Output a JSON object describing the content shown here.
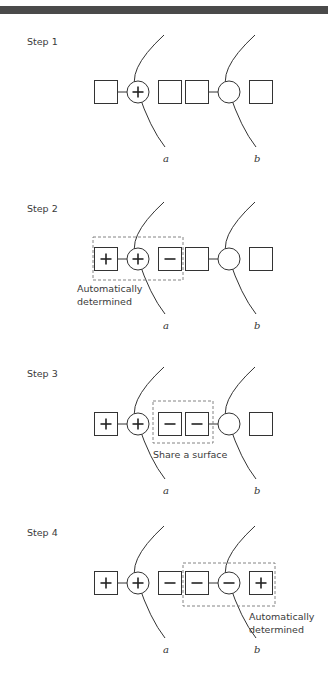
{
  "header": {
    "bar_color": "#4a4a4a"
  },
  "colors": {
    "stroke": "#333333",
    "dashed": "#777777",
    "text": "#3a3a3a"
  },
  "surfaces": {
    "a_label": "a",
    "b_label": "b"
  },
  "steps": [
    {
      "label": "Step 1",
      "row_y": 92,
      "elements": [
        {
          "type": "square",
          "x": 106,
          "sign": ""
        },
        {
          "type": "circle",
          "x": 138,
          "sign": "+"
        },
        {
          "type": "square",
          "x": 170,
          "sign": ""
        },
        {
          "type": "square",
          "x": 197,
          "sign": ""
        },
        {
          "type": "circle",
          "x": 229,
          "sign": ""
        },
        {
          "type": "square",
          "x": 261,
          "sign": ""
        }
      ],
      "links": [
        [
          117,
          127
        ],
        [
          208,
          218
        ]
      ],
      "dashed_box": null,
      "note": []
    },
    {
      "label": "Step 2",
      "row_y": 259,
      "elements": [
        {
          "type": "square",
          "x": 106,
          "sign": "+"
        },
        {
          "type": "circle",
          "x": 138,
          "sign": "+"
        },
        {
          "type": "square",
          "x": 170,
          "sign": "−"
        },
        {
          "type": "square",
          "x": 197,
          "sign": ""
        },
        {
          "type": "circle",
          "x": 229,
          "sign": ""
        },
        {
          "type": "square",
          "x": 261,
          "sign": ""
        }
      ],
      "links": [
        [
          117,
          127
        ],
        [
          208,
          218
        ]
      ],
      "dashed_box": {
        "x": 93,
        "y": 237,
        "w": 90,
        "h": 43
      },
      "note": [
        "Automatically",
        "determined"
      ],
      "note_pos": {
        "x": 77,
        "y": 292
      }
    },
    {
      "label": "Step 3",
      "row_y": 424,
      "elements": [
        {
          "type": "square",
          "x": 106,
          "sign": "+"
        },
        {
          "type": "circle",
          "x": 138,
          "sign": "+"
        },
        {
          "type": "square",
          "x": 170,
          "sign": "−"
        },
        {
          "type": "square",
          "x": 197,
          "sign": "−"
        },
        {
          "type": "circle",
          "x": 229,
          "sign": ""
        },
        {
          "type": "square",
          "x": 261,
          "sign": ""
        }
      ],
      "links": [
        [
          117,
          127
        ],
        [
          208,
          218
        ]
      ],
      "dashed_box": {
        "x": 153,
        "y": 401,
        "w": 60,
        "h": 42
      },
      "note": [
        "Share a surface"
      ],
      "note_pos": {
        "x": 153,
        "y": 458
      }
    },
    {
      "label": "Step 4",
      "row_y": 583,
      "elements": [
        {
          "type": "square",
          "x": 106,
          "sign": "+"
        },
        {
          "type": "circle",
          "x": 138,
          "sign": "+"
        },
        {
          "type": "square",
          "x": 170,
          "sign": "−"
        },
        {
          "type": "square",
          "x": 197,
          "sign": "−"
        },
        {
          "type": "circle",
          "x": 229,
          "sign": "−"
        },
        {
          "type": "square",
          "x": 261,
          "sign": "+"
        }
      ],
      "links": [
        [
          117,
          127
        ],
        [
          208,
          218
        ]
      ],
      "dashed_box": {
        "x": 183,
        "y": 563,
        "w": 92,
        "h": 43
      },
      "note": [
        "Automatically",
        "determined"
      ],
      "note_pos": {
        "x": 249,
        "y": 620
      }
    }
  ]
}
